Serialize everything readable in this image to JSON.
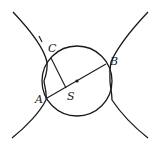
{
  "diagram": {
    "type": "geometry",
    "points": {
      "A": {
        "label": "A",
        "x": 47,
        "y": 98
      },
      "B": {
        "label": "B",
        "x": 106,
        "y": 64
      },
      "C": {
        "label": "C",
        "x": 51,
        "y": 58
      },
      "S": {
        "label": "S",
        "x": 67,
        "y": 87
      },
      "O": {
        "label": "",
        "x": 77,
        "y": 81
      }
    },
    "circle": {
      "cx": 77,
      "cy": 81,
      "r": 35
    },
    "labels": {
      "A": "A",
      "B": "B",
      "C": "C",
      "S": "S"
    },
    "stroke_color": "#1a1a1a",
    "background": "#ffffff"
  }
}
